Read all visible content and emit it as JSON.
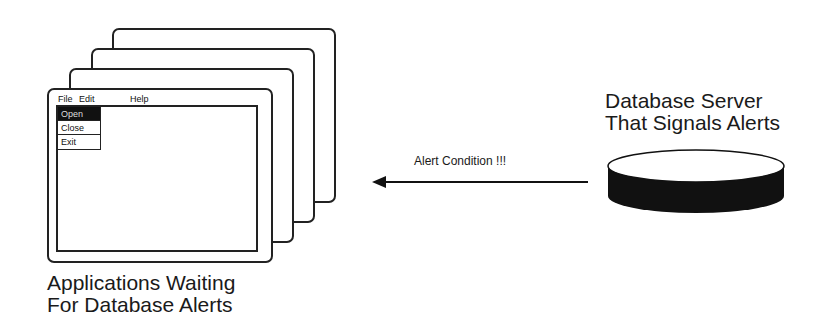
{
  "app_windows": {
    "count": 4,
    "front_window": {
      "menu": [
        "File",
        "Edit",
        "Help"
      ],
      "dropdown": {
        "items": [
          {
            "label": "Open",
            "selected": true
          },
          {
            "label": "Close",
            "selected": false
          },
          {
            "label": "Exit",
            "selected": false
          }
        ]
      }
    },
    "caption_line1": "Applications Waiting",
    "caption_line2": "For Database Alerts"
  },
  "arrow": {
    "label": "Alert Condition !!!",
    "direction": "right-to-left"
  },
  "database": {
    "caption_line1": "Database Server",
    "caption_line2": "That Signals Alerts",
    "icon": "database-cylinder-icon"
  },
  "colors": {
    "line": "#222222",
    "fill_dark": "#111111",
    "background": "#ffffff"
  }
}
